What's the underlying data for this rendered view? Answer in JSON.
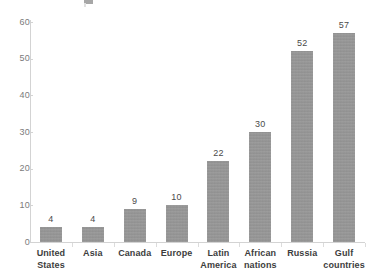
{
  "chart_data": {
    "type": "bar",
    "title": "",
    "xlabel": "",
    "ylabel": "",
    "ylim": [
      0,
      60
    ],
    "ytick_step": 10,
    "yticks": [
      "0",
      "10",
      "20",
      "30",
      "40",
      "50",
      "60"
    ],
    "grid": false,
    "legend": "none",
    "bar_color": "#969696",
    "axis_color": "#d3d3d3",
    "label_color": "#3d3d3d",
    "categories": [
      "United States",
      "Asia",
      "Canada",
      "Europe",
      "Latin America",
      "African nations",
      "Russia",
      "Gulf countries"
    ],
    "category_lines": [
      [
        "United",
        "States"
      ],
      [
        "Asia",
        ""
      ],
      [
        "Canada",
        ""
      ],
      [
        "Europe",
        ""
      ],
      [
        "Latin",
        "America"
      ],
      [
        "African",
        "nations"
      ],
      [
        "Russia",
        ""
      ],
      [
        "Gulf",
        "countries"
      ]
    ],
    "values": [
      4,
      4,
      9,
      10,
      22,
      30,
      52,
      57
    ],
    "value_labels": [
      "4",
      "4",
      "9",
      "10",
      "22",
      "30",
      "52",
      "57"
    ]
  }
}
